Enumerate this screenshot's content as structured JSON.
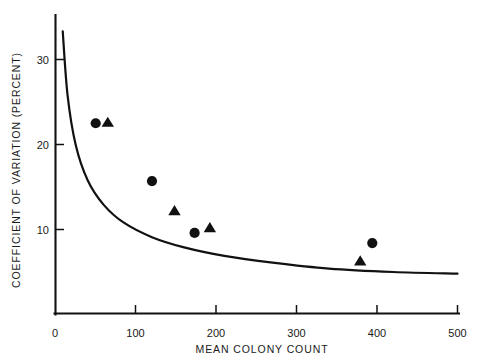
{
  "chart_data": {
    "type": "scatter",
    "title": "",
    "xlabel": "MEAN COLONY COUNT",
    "ylabel": "COEFFICIENT OF VARIATION (PERCENT)",
    "xlim": [
      0,
      500
    ],
    "ylim": [
      0,
      35
    ],
    "grid": false,
    "legend_position": "none",
    "xticks": [
      0,
      100,
      200,
      300,
      400,
      500
    ],
    "xtick_labels": [
      "0",
      "100",
      "200",
      "300",
      "400",
      "500"
    ],
    "yticks": [
      10,
      20,
      30
    ],
    "ytick_labels": [
      "10",
      "20",
      "30"
    ],
    "series": [
      {
        "name": "circles",
        "marker": "circle",
        "color": "#111111",
        "points": [
          {
            "x": 50,
            "y": 22.5
          },
          {
            "x": 120,
            "y": 15.7
          },
          {
            "x": 173,
            "y": 9.6
          },
          {
            "x": 394,
            "y": 8.4
          }
        ]
      },
      {
        "name": "triangles",
        "marker": "triangle",
        "color": "#111111",
        "points": [
          {
            "x": 65,
            "y": 22.6
          },
          {
            "x": 148,
            "y": 12.2
          },
          {
            "x": 192,
            "y": 10.2
          },
          {
            "x": 379,
            "y": 6.3
          }
        ]
      },
      {
        "name": "theoretical-curve",
        "marker": "line",
        "color": "#111111",
        "curve_formula": "CV = 100 / sqrt(N)",
        "points": [
          {
            "x": 9,
            "y": 33.3
          },
          {
            "x": 15,
            "y": 25.8
          },
          {
            "x": 25,
            "y": 20.0
          },
          {
            "x": 40,
            "y": 15.8
          },
          {
            "x": 60,
            "y": 12.9
          },
          {
            "x": 85,
            "y": 10.8
          },
          {
            "x": 120,
            "y": 9.1
          },
          {
            "x": 160,
            "y": 7.9
          },
          {
            "x": 210,
            "y": 6.9
          },
          {
            "x": 270,
            "y": 6.1
          },
          {
            "x": 340,
            "y": 5.4
          },
          {
            "x": 420,
            "y": 5.0
          },
          {
            "x": 500,
            "y": 4.8
          }
        ]
      }
    ]
  },
  "axes": {
    "x_axis_label": "MEAN COLONY COUNT",
    "y_axis_label": "COEFFICIENT OF VARIATION (PERCENT)",
    "x_tick_0": "0",
    "x_tick_100": "100",
    "x_tick_200": "200",
    "x_tick_300": "300",
    "x_tick_400": "400",
    "x_tick_500": "500",
    "y_tick_10": "10",
    "y_tick_20": "20",
    "y_tick_30": "30"
  },
  "style": {
    "axis_color": "#111111",
    "marker_color": "#111111",
    "background": "#ffffff"
  }
}
